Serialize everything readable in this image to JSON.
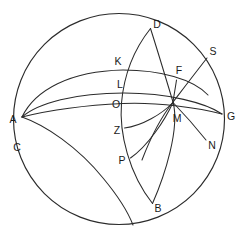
{
  "diagram": {
    "stroke_color": "#2b2b2b",
    "background_color": "#ffffff",
    "label_color": "#1a1a1a",
    "outer_circle": {
      "cx": 119,
      "cy": 119,
      "r": 105.5
    },
    "points": [
      {
        "id": "A",
        "label": "A",
        "x": 13,
        "y": 120,
        "anchor_x": 22,
        "anchor_y": 117
      },
      {
        "id": "B",
        "label": "B",
        "x": 158,
        "y": 209,
        "anchor_x": 152,
        "anchor_y": 203
      },
      {
        "id": "C",
        "label": "C",
        "x": 17,
        "y": 148,
        "anchor_x": 26,
        "anchor_y": 143
      },
      {
        "id": "D",
        "label": "D",
        "x": 157,
        "y": 25,
        "anchor_x": 150,
        "anchor_y": 29
      },
      {
        "id": "F",
        "label": "F",
        "x": 179,
        "y": 71,
        "anchor_x": 176,
        "anchor_y": 80
      },
      {
        "id": "G",
        "label": "G",
        "x": 231,
        "y": 117,
        "anchor_x": 222,
        "anchor_y": 114
      },
      {
        "id": "K",
        "label": "K",
        "x": 118,
        "y": 62,
        "anchor_x": 123,
        "anchor_y": 70
      },
      {
        "id": "L",
        "label": "L",
        "x": 120,
        "y": 85,
        "anchor_x": 124,
        "anchor_y": 93
      },
      {
        "id": "M",
        "label": "M",
        "x": 177,
        "y": 119,
        "anchor_x": 173,
        "anchor_y": 102
      },
      {
        "id": "N",
        "label": "N",
        "x": 212,
        "y": 146,
        "anchor_x": 206,
        "anchor_y": 139
      },
      {
        "id": "O",
        "label": "O",
        "x": 116,
        "y": 105,
        "anchor_x": 123,
        "anchor_y": 104
      },
      {
        "id": "P",
        "label": "P",
        "x": 122,
        "y": 161,
        "anchor_x": 131,
        "anchor_y": 158
      },
      {
        "id": "S",
        "label": "S",
        "x": 213,
        "y": 52,
        "anchor_x": 207,
        "anchor_y": 58
      },
      {
        "id": "Z",
        "label": "Z",
        "x": 117,
        "y": 131,
        "anchor_x": 125,
        "anchor_y": 128
      }
    ],
    "curves": [
      {
        "id": "outer-sphere-circle",
        "name": "outer-sphere-circle",
        "d": "M 13.5 119 A 105.5 105.5 0 1 1 224.5 119 A 105.5 105.5 0 1 1 13.5 119 Z"
      },
      {
        "id": "arc-D-O-B",
        "name": "arc-meridian-D-K-L-O-Z-P-B",
        "d": "M 150.5 28.5 C 135 48 124 74 121.5 103 C 119 133 129 174 152.5 203.5"
      },
      {
        "id": "arc-A-K-D",
        "name": "arc-great-circle-A-K-D-S",
        "d": "M 22 117 C 35 90 70 71 123 70 C 160 70 193 79 208 95"
      },
      {
        "id": "arc-A-L-G",
        "name": "arc-great-circle-A-L-F-G",
        "d": "M 22 117 C 38 103 75 93 124 93 C 168 93 206 103 222 114"
      },
      {
        "id": "arc-A-O-G",
        "name": "arc-horizon-A-O-M-G",
        "d": "M 22 117 C 50 110 90 105 123 103.5 C 158 102 200 108 222 114"
      },
      {
        "id": "arc-A-C-down",
        "name": "arc-from-A-through-C",
        "d": "M 22 117 C 45 125 78 147 103 178 C 118 196 128 212 133 225"
      },
      {
        "id": "arc-S-M-N",
        "name": "arc-great-circle-S-M-N",
        "d": "M 207 58 C 196 72 183 89 173 102 C 162 116 150 139 142 160"
      },
      {
        "id": "arc-D-M-B",
        "name": "arc-great-circle-D-F-M-B",
        "d": "M 150.5 28.5 C 158 52 167 82 173 102 C 180 128 165 175 152.5 203.5"
      },
      {
        "id": "seg-F-M",
        "name": "segment-F-to-M",
        "d": "M 176.5 80 C 175.5 87 174 95 173 102"
      },
      {
        "id": "arc-Z-M",
        "name": "arc-Z-to-M",
        "d": "M 124.5 128 C 142 126 162 114 173 102.5"
      },
      {
        "id": "arc-P-M",
        "name": "arc-P-to-M",
        "d": "M 130.5 158 C 148 146 165 120 173 102.5"
      },
      {
        "id": "arc-M-N-G",
        "name": "arc-M-to-N-to-G",
        "d": "M 173 102.5 C 186 116 198 130 206 140"
      }
    ]
  }
}
